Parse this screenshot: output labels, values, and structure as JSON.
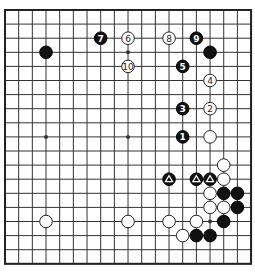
{
  "board": {
    "size": 19,
    "origin": [
      5,
      10
    ],
    "step": [
      13.67,
      14.1
    ],
    "star_points": [
      [
        3,
        3
      ],
      [
        9,
        3
      ],
      [
        15,
        3
      ],
      [
        3,
        9
      ],
      [
        9,
        9
      ],
      [
        15,
        9
      ],
      [
        3,
        15
      ],
      [
        9,
        15
      ],
      [
        15,
        15
      ]
    ],
    "colors": {
      "line": "#333333",
      "black": "#111111",
      "white": "#ffffff"
    }
  },
  "stones": [
    {
      "color": "black",
      "col": 3,
      "row": 3,
      "label": ""
    },
    {
      "color": "black",
      "col": 15,
      "row": 3,
      "label": ""
    },
    {
      "color": "black",
      "col": 13,
      "row": 9,
      "label": "1"
    },
    {
      "color": "white",
      "col": 15,
      "row": 7,
      "label": "2"
    },
    {
      "color": "black",
      "col": 13,
      "row": 7,
      "label": "3"
    },
    {
      "color": "white",
      "col": 15,
      "row": 5,
      "label": "4"
    },
    {
      "color": "black",
      "col": 13,
      "row": 4,
      "label": "5"
    },
    {
      "color": "white",
      "col": 9,
      "row": 2,
      "label": "6"
    },
    {
      "color": "black",
      "col": 7,
      "row": 2,
      "label": "7"
    },
    {
      "color": "white",
      "col": 12,
      "row": 2,
      "label": "8"
    },
    {
      "color": "black",
      "col": 14,
      "row": 2,
      "label": "9"
    },
    {
      "color": "white",
      "col": 9,
      "row": 4,
      "label": "10"
    },
    {
      "color": "white",
      "col": 15,
      "row": 9,
      "label": ""
    },
    {
      "color": "white",
      "col": 16,
      "row": 11,
      "label": ""
    },
    {
      "color": "black",
      "col": 12,
      "row": 12,
      "label": "triangle"
    },
    {
      "color": "black",
      "col": 14,
      "row": 12,
      "label": "triangle"
    },
    {
      "color": "black",
      "col": 15,
      "row": 12,
      "label": "triangle"
    },
    {
      "color": "white",
      "col": 16,
      "row": 12,
      "label": ""
    },
    {
      "color": "white",
      "col": 15,
      "row": 13,
      "label": ""
    },
    {
      "color": "black",
      "col": 16,
      "row": 13,
      "label": ""
    },
    {
      "color": "black",
      "col": 17,
      "row": 13,
      "label": ""
    },
    {
      "color": "white",
      "col": 15,
      "row": 14,
      "label": ""
    },
    {
      "color": "white",
      "col": 16,
      "row": 14,
      "label": ""
    },
    {
      "color": "black",
      "col": 17,
      "row": 14,
      "label": ""
    },
    {
      "color": "white",
      "col": 12,
      "row": 15,
      "label": ""
    },
    {
      "color": "white",
      "col": 14,
      "row": 15,
      "label": ""
    },
    {
      "color": "black",
      "col": 16,
      "row": 15,
      "label": ""
    },
    {
      "color": "white",
      "col": 13,
      "row": 16,
      "label": ""
    },
    {
      "color": "black",
      "col": 14,
      "row": 16,
      "label": ""
    },
    {
      "color": "black",
      "col": 15,
      "row": 16,
      "label": ""
    },
    {
      "color": "white",
      "col": 3,
      "row": 15,
      "label": ""
    },
    {
      "color": "white",
      "col": 9,
      "row": 15,
      "label": ""
    }
  ]
}
